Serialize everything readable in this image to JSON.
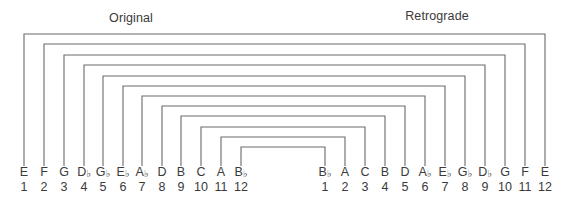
{
  "titles": {
    "original": "Original",
    "retrograde": "Retrograde"
  },
  "colors": {
    "line": "#6a6a6a",
    "text": "#3a3a3a",
    "background": "#ffffff"
  },
  "original": {
    "notes": [
      {
        "letter": "E",
        "accidental": "",
        "number": "1"
      },
      {
        "letter": "F",
        "accidental": "",
        "number": "2"
      },
      {
        "letter": "G",
        "accidental": "",
        "number": "3"
      },
      {
        "letter": "D",
        "accidental": "♭",
        "number": "4"
      },
      {
        "letter": "G",
        "accidental": "♭",
        "number": "5"
      },
      {
        "letter": "E",
        "accidental": "♭",
        "number": "6"
      },
      {
        "letter": "A",
        "accidental": "♭",
        "number": "7"
      },
      {
        "letter": "D",
        "accidental": "",
        "number": "8"
      },
      {
        "letter": "B",
        "accidental": "",
        "number": "9"
      },
      {
        "letter": "C",
        "accidental": "",
        "number": "10"
      },
      {
        "letter": "A",
        "accidental": "",
        "number": "11"
      },
      {
        "letter": "B",
        "accidental": "♭",
        "number": "12"
      }
    ],
    "x": [
      24,
      44,
      64,
      84,
      103,
      123,
      142,
      162,
      181,
      201,
      221,
      241
    ]
  },
  "retrograde": {
    "notes": [
      {
        "letter": "B",
        "accidental": "♭",
        "number": "1"
      },
      {
        "letter": "A",
        "accidental": "",
        "number": "2"
      },
      {
        "letter": "C",
        "accidental": "",
        "number": "3"
      },
      {
        "letter": "B",
        "accidental": "",
        "number": "4"
      },
      {
        "letter": "D",
        "accidental": "",
        "number": "5"
      },
      {
        "letter": "A",
        "accidental": "♭",
        "number": "6"
      },
      {
        "letter": "E",
        "accidental": "♭",
        "number": "7"
      },
      {
        "letter": "G",
        "accidental": "♭",
        "number": "8"
      },
      {
        "letter": "D",
        "accidental": "♭",
        "number": "9"
      },
      {
        "letter": "G",
        "accidental": "",
        "number": "10"
      },
      {
        "letter": "F",
        "accidental": "",
        "number": "11"
      },
      {
        "letter": "E",
        "accidental": "",
        "number": "12"
      }
    ],
    "x": [
      325,
      345,
      365,
      385,
      405,
      425,
      445,
      465,
      485,
      505,
      525,
      545
    ]
  },
  "brackets": {
    "bottom_y": 166,
    "levels_y": [
      34,
      44,
      55,
      65,
      76,
      86,
      96,
      106,
      116,
      127,
      137,
      147
    ]
  },
  "layout": {
    "title_original_x": 131,
    "title_original_y": 11,
    "title_retrograde_x": 437,
    "title_retrograde_y": 9,
    "note_row_y": 166
  }
}
